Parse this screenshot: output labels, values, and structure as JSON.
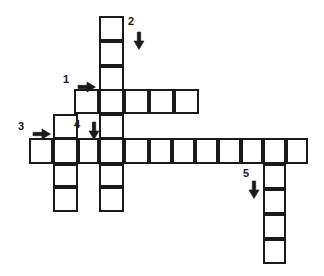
{
  "puzzle": {
    "title": "Crossword puzzle grid",
    "background_color": "#ffffff",
    "line_color": "#1a1a1a",
    "cell_fill_color": "#ffffff",
    "cell_size": 23.3,
    "origin_x": 29,
    "origin_y": 16,
    "canvas_width": 324,
    "canvas_height": 276
  },
  "clues": [
    {
      "number": "1",
      "direction": "across",
      "arrow": "right-arrow",
      "label_x": 63,
      "label_y": 74,
      "arrow_x": 78,
      "arrow_y": 81,
      "length": 5,
      "start_col": 2,
      "start_row": 3
    },
    {
      "number": "2",
      "direction": "down",
      "arrow": "down-arrow",
      "label_x": 128,
      "label_y": 16,
      "arrow_x": 133,
      "arrow_y": 32,
      "length": 5,
      "start_col": 3,
      "start_row": 0
    },
    {
      "number": "3",
      "direction": "across",
      "arrow": "right-arrow",
      "label_x": 18,
      "label_y": 121,
      "arrow_x": 33,
      "arrow_y": 128,
      "length": 12,
      "start_col": 0,
      "start_row": 5
    },
    {
      "number": "4",
      "direction": "down",
      "arrow": "down-arrow",
      "label_x": 74,
      "label_y": 119,
      "arrow_x": 88,
      "arrow_y": 122,
      "length": 4,
      "start_col": 2,
      "start_row": 4
    },
    {
      "number": "5",
      "direction": "down",
      "arrow": "down-arrow",
      "label_x": 243,
      "label_y": 168,
      "arrow_x": 248,
      "arrow_y": 181,
      "length": 5,
      "start_col": 10,
      "start_row": 5
    }
  ],
  "cells": [
    {
      "x": 99,
      "y": 16,
      "w": 25,
      "h": 25,
      "id": "c-2-1"
    },
    {
      "x": 99,
      "y": 41,
      "w": 25,
      "h": 25,
      "id": "c-2-2"
    },
    {
      "x": 99,
      "y": 66,
      "w": 25,
      "h": 25,
      "id": "c-2-3"
    },
    {
      "x": 74,
      "y": 89,
      "w": 25,
      "h": 25,
      "id": "c-1-1"
    },
    {
      "x": 99,
      "y": 89,
      "w": 25,
      "h": 25,
      "id": "c-1-2"
    },
    {
      "x": 124,
      "y": 89,
      "w": 25,
      "h": 25,
      "id": "c-1-3"
    },
    {
      "x": 149,
      "y": 89,
      "w": 25,
      "h": 25,
      "id": "c-1-4"
    },
    {
      "x": 174,
      "y": 89,
      "w": 25,
      "h": 25,
      "id": "c-1-5"
    },
    {
      "x": 53,
      "y": 114,
      "w": 25,
      "h": 25,
      "id": "c-3a-1"
    },
    {
      "x": 99,
      "y": 114,
      "w": 25,
      "h": 25,
      "id": "c-2-4"
    },
    {
      "x": 29,
      "y": 138,
      "w": 24,
      "h": 26,
      "id": "c-3-1"
    },
    {
      "x": 53,
      "y": 138,
      "w": 25,
      "h": 26,
      "id": "c-3-2"
    },
    {
      "x": 78,
      "y": 138,
      "w": 21,
      "h": 26,
      "id": "c-3-3"
    },
    {
      "x": 99,
      "y": 138,
      "w": 25,
      "h": 26,
      "id": "c-3-4"
    },
    {
      "x": 124,
      "y": 138,
      "w": 25,
      "h": 26,
      "id": "c-3-5"
    },
    {
      "x": 149,
      "y": 138,
      "w": 23,
      "h": 26,
      "id": "c-3-6"
    },
    {
      "x": 172,
      "y": 138,
      "w": 23,
      "h": 26,
      "id": "c-3-7"
    },
    {
      "x": 195,
      "y": 138,
      "w": 23,
      "h": 26,
      "id": "c-3-8"
    },
    {
      "x": 218,
      "y": 138,
      "w": 23,
      "h": 26,
      "id": "c-3-9"
    },
    {
      "x": 241,
      "y": 138,
      "w": 22,
      "h": 26,
      "id": "c-3-10"
    },
    {
      "x": 263,
      "y": 138,
      "w": 23,
      "h": 26,
      "id": "c-3-11"
    },
    {
      "x": 286,
      "y": 138,
      "w": 22,
      "h": 26,
      "id": "c-3-12"
    },
    {
      "x": 53,
      "y": 164,
      "w": 25,
      "h": 23,
      "id": "c-4a-1"
    },
    {
      "x": 99,
      "y": 164,
      "w": 25,
      "h": 23,
      "id": "c-2-5"
    },
    {
      "x": 53,
      "y": 187,
      "w": 25,
      "h": 25,
      "id": "c-4a-2"
    },
    {
      "x": 99,
      "y": 187,
      "w": 25,
      "h": 25,
      "id": "c-2-6"
    },
    {
      "x": 263,
      "y": 164,
      "w": 23,
      "h": 25,
      "id": "c-5-1"
    },
    {
      "x": 263,
      "y": 189,
      "w": 23,
      "h": 25,
      "id": "c-5-2"
    },
    {
      "x": 263,
      "y": 214,
      "w": 23,
      "h": 25,
      "id": "c-5-3"
    },
    {
      "x": 263,
      "y": 239,
      "w": 23,
      "h": 25,
      "id": "c-5-4"
    }
  ]
}
